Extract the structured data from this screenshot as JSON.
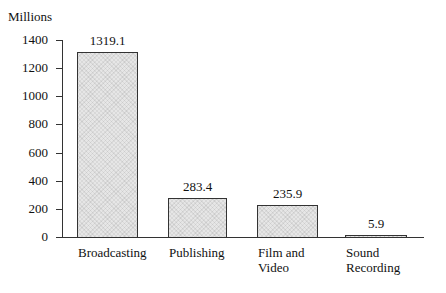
{
  "chart_data": {
    "type": "bar",
    "title": "",
    "xlabel": "",
    "ylabel": "Millions",
    "ylim": [
      0,
      1400
    ],
    "yticks": [
      "0",
      "200",
      "400",
      "600",
      "800",
      "1000",
      "1200",
      "1400"
    ],
    "categories": [
      "Broadcasting",
      "Publishing",
      "Film and Video",
      "Sound Recording"
    ],
    "values": [
      1319.1,
      283.4,
      235.9,
      5.9
    ],
    "value_labels": [
      "1319.1",
      "283.4",
      "235.9",
      "5.9"
    ],
    "grid": false,
    "legend": null
  },
  "display": {
    "cat_lines": [
      [
        "Broadcasting"
      ],
      [
        "Publishing"
      ],
      [
        "Film and",
        "Video"
      ],
      [
        "Sound",
        "Recording"
      ]
    ]
  }
}
